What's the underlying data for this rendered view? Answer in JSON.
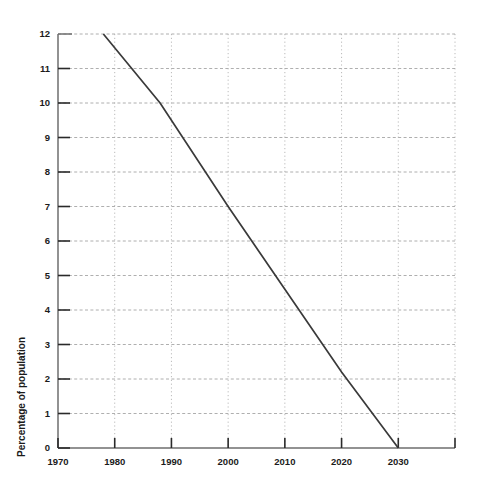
{
  "chart_data": {
    "type": "line",
    "title": "",
    "xlabel": "",
    "ylabel": "Percentage of population",
    "xlim": [
      1970,
      2040
    ],
    "ylim": [
      0,
      12
    ],
    "grid": true,
    "legend": false,
    "x_ticks": [
      1970,
      1980,
      1990,
      2000,
      2010,
      2020,
      2030,
      2040
    ],
    "x_tick_labels": [
      "1970",
      "1980",
      "1990",
      "2000",
      "2010",
      "2020",
      "2030",
      ""
    ],
    "y_ticks": [
      0,
      1,
      2,
      3,
      4,
      5,
      6,
      7,
      8,
      9,
      10,
      11,
      12
    ],
    "y_tick_labels": [
      "0",
      "1",
      "2",
      "3",
      "4",
      "5",
      "6",
      "7",
      "8",
      "9",
      "10",
      "11",
      "12"
    ],
    "series": [
      {
        "name": "Percentage of population",
        "color": "#3a3a3a",
        "x": [
          1978,
          1988,
          2000,
          2010,
          2020,
          2030
        ],
        "values": [
          12.0,
          10.0,
          7.0,
          4.6,
          2.2,
          0.0
        ]
      }
    ]
  },
  "axis": {
    "y_title": "Percentage of population"
  }
}
